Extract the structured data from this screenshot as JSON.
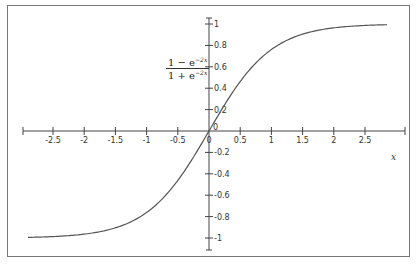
{
  "chart_data": {
    "type": "line",
    "title": "",
    "function_label": {
      "numerator": "1 − e",
      "numerator_exp": "−2x",
      "denominator": "1 + e",
      "denominator_exp": "−2x"
    },
    "xlabel": "x",
    "ylabel": "",
    "xlim": [
      -2.9,
      2.9
    ],
    "ylim": [
      -1,
      1
    ],
    "x_ticks": [
      "-2.5",
      "-2",
      "-1.5",
      "-1",
      "-0.5",
      "0",
      "0.5",
      "1",
      "1.5",
      "2",
      "2.5"
    ],
    "y_ticks": [
      "1",
      "0.8",
      "0.6",
      "0.4",
      "0.2",
      "0",
      "-0.2",
      "-0.4",
      "-0.6",
      "-0.8",
      "-1"
    ],
    "grid": false,
    "legend": "none",
    "series": [
      {
        "name": "(1 − e^(−2x)) / (1 + e^(−2x))",
        "x": [
          -2.9,
          -2.5,
          -2,
          -1.5,
          -1,
          -0.5,
          0,
          0.5,
          1,
          1.5,
          2,
          2.5,
          2.85
        ],
        "values": [
          -0.994,
          -0.987,
          -0.964,
          -0.905,
          -0.762,
          -0.462,
          0,
          0.462,
          0.762,
          0.905,
          0.964,
          0.987,
          0.993
        ]
      }
    ]
  }
}
